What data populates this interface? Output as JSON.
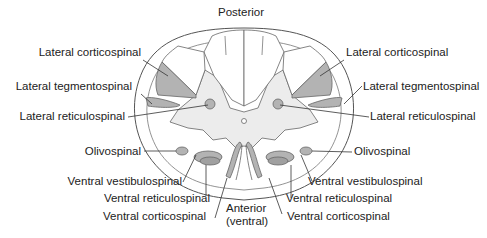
{
  "orientation": {
    "top": "Posterior",
    "bottom_line1": "Anterior",
    "bottom_line2": "(ventral)"
  },
  "labels_left": [
    {
      "id": "lateral-corticospinal",
      "text": "Lateral corticospinal"
    },
    {
      "id": "lateral-tegmentospinal",
      "text": "Lateral tegmentospinal"
    },
    {
      "id": "lateral-reticulospinal",
      "text": "Lateral reticulospinal"
    },
    {
      "id": "olivospinal",
      "text": "Olivospinal"
    },
    {
      "id": "ventral-vestibulospinal",
      "text": "Ventral vestibulospinal"
    },
    {
      "id": "ventral-reticulospinal",
      "text": "Ventral reticulospinal"
    },
    {
      "id": "ventral-corticospinal",
      "text": "Ventral corticospinal"
    }
  ],
  "labels_right": [
    {
      "id": "lateral-corticospinal",
      "text": "Lateral corticospinal"
    },
    {
      "id": "lateral-tegmentospinal",
      "text": "Lateral tegmentospinal"
    },
    {
      "id": "lateral-reticulospinal",
      "text": "Lateral reticulospinal"
    },
    {
      "id": "olivospinal",
      "text": "Olivospinal"
    },
    {
      "id": "ventral-vestibulospinal",
      "text": "Ventral vestibulospinal"
    },
    {
      "id": "ventral-reticulospinal",
      "text": "Ventral reticulospinal"
    },
    {
      "id": "ventral-corticospinal",
      "text": "Ventral corticospinal"
    }
  ],
  "colors": {
    "tract_fill": "#b3b3b3",
    "grey_matter": "#ececec",
    "outline": "#555555",
    "leader": "#333333",
    "text": "#222222"
  }
}
